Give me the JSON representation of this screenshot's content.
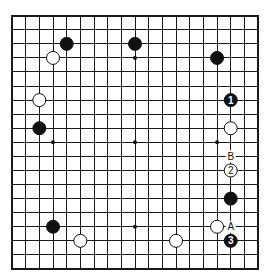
{
  "board": {
    "size": 19,
    "origin_x": 12,
    "origin_y": 15.7,
    "spacing_x": 13.67,
    "spacing_y": 14.07,
    "stone_radius": 6.5,
    "colors": {
      "line": "#1a1a1a",
      "black": "#111111",
      "white": "#ffffff"
    }
  },
  "star_points": [
    [
      3,
      3
    ],
    [
      9,
      3
    ],
    [
      15,
      3
    ],
    [
      3,
      9
    ],
    [
      9,
      9
    ],
    [
      15,
      9
    ],
    [
      3,
      15
    ],
    [
      9,
      15
    ],
    [
      15,
      15
    ]
  ],
  "stones": [
    {
      "color": "black",
      "col": 4,
      "row": 2,
      "label": ""
    },
    {
      "color": "black",
      "col": 9,
      "row": 2,
      "label": ""
    },
    {
      "color": "white",
      "col": 3,
      "row": 3,
      "label": ""
    },
    {
      "color": "black",
      "col": 15,
      "row": 3,
      "label": ""
    },
    {
      "color": "white",
      "col": 2,
      "row": 6,
      "label": ""
    },
    {
      "color": "black",
      "col": 16,
      "row": 6,
      "label": "1"
    },
    {
      "color": "black",
      "col": 2,
      "row": 8,
      "label": ""
    },
    {
      "color": "white",
      "col": 16,
      "row": 8,
      "label": ""
    },
    {
      "color": "white",
      "col": 16,
      "row": 11,
      "label": "2"
    },
    {
      "color": "black",
      "col": 16,
      "row": 13,
      "label": ""
    },
    {
      "color": "black",
      "col": 3,
      "row": 15,
      "label": ""
    },
    {
      "color": "white",
      "col": 15,
      "row": 15,
      "label": ""
    },
    {
      "color": "white",
      "col": 5,
      "row": 16,
      "label": ""
    },
    {
      "color": "white",
      "col": 12,
      "row": 16,
      "label": ""
    },
    {
      "color": "black",
      "col": 16,
      "row": 16,
      "label": "3"
    }
  ],
  "markers": [
    {
      "text": "B",
      "col": 16,
      "row": 10
    },
    {
      "text": "A",
      "col": 16,
      "row": 15
    }
  ]
}
